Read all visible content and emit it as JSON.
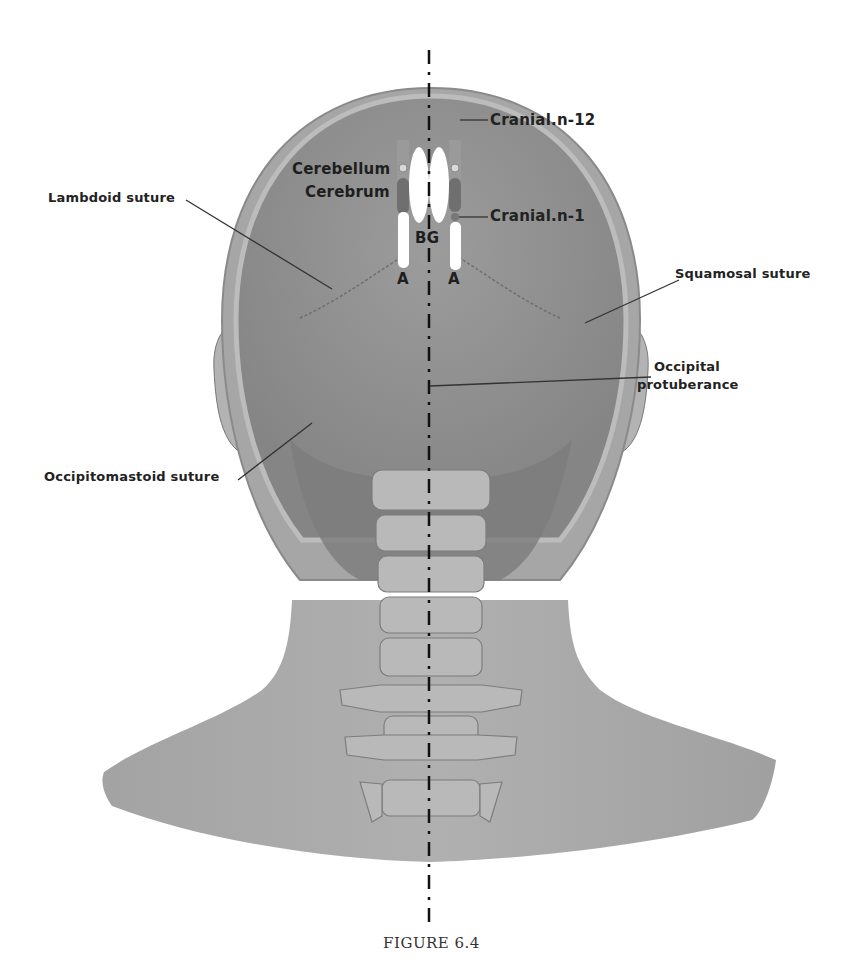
{
  "figure": {
    "caption": "FIGURE 6.4",
    "view": "posterior view of head and neck with midline axis"
  },
  "labels": {
    "cranial_n12": "Cranial.n-12",
    "cerebellum": "Cerebellum",
    "cerebrum": "Cerebrum",
    "cranial_n1": "Cranial.n-1",
    "bg": "BG",
    "a_left": "A",
    "a_right": "A",
    "lambdoid_suture": "Lambdoid suture",
    "squamosal_suture": "Squamosal suture",
    "occipital_protuberance_line1": "Occipital",
    "occipital_protuberance_line2": "protuberance",
    "occipitomastoid_suture": "Occipitomastoid suture"
  },
  "colors": {
    "skin": "#a9a9a9",
    "skull": "#8e8e8e",
    "bone": "#b5b5b5",
    "electrode": "#ffffff",
    "marker": "#7a7a7a",
    "axis": "#111111",
    "leader": "#333333"
  }
}
